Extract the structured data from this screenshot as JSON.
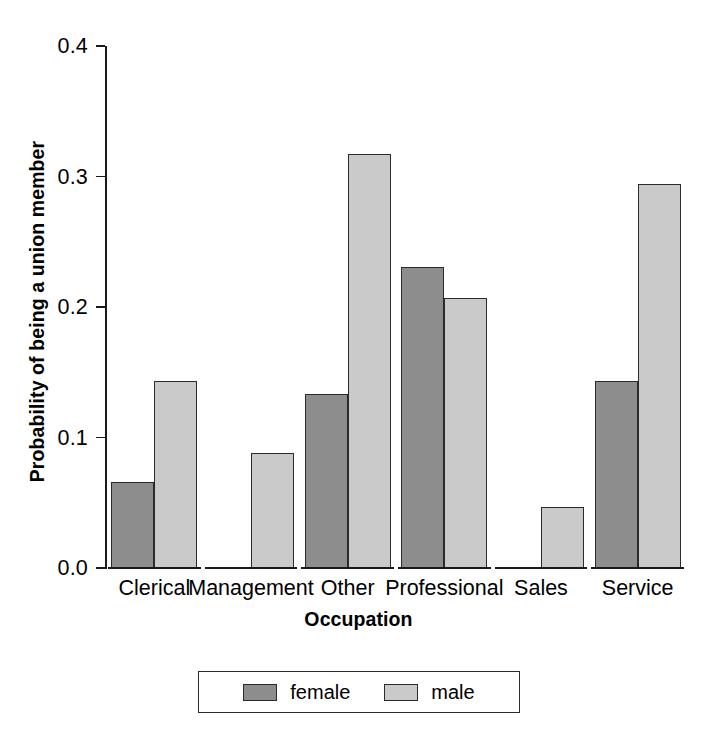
{
  "chart_data": {
    "type": "bar",
    "title": "",
    "xlabel": "Occupation",
    "ylabel": "Probability of being a union member",
    "categories": [
      "Clerical",
      "Management",
      "Other",
      "Professional",
      "Sales",
      "Service"
    ],
    "series": [
      {
        "name": "female",
        "color": "#8d8d8d",
        "values": [
          0.066,
          0.0,
          0.133,
          0.231,
          0.0,
          0.143
        ]
      },
      {
        "name": "male",
        "color": "#cacaca",
        "values": [
          0.143,
          0.088,
          0.317,
          0.207,
          0.047,
          0.294
        ]
      }
    ],
    "ylim": [
      0.0,
      0.4
    ],
    "ytick_labels": [
      "0.0",
      "0.1",
      "0.2",
      "0.3",
      "0.4"
    ],
    "ytick_values": [
      0.0,
      0.1,
      0.2,
      0.3,
      0.4
    ],
    "grid": false,
    "legend_position": "bottom",
    "legend_entries": [
      "female",
      "male"
    ]
  },
  "axes": {
    "y_title": "Probability of being a union member",
    "x_title": "Occupation"
  },
  "legend": {
    "female_label": "female",
    "male_label": "male"
  },
  "colors": {
    "female": "#8d8d8d",
    "male": "#cacaca",
    "outline": "#2b2b2b",
    "background": "#ffffff"
  }
}
